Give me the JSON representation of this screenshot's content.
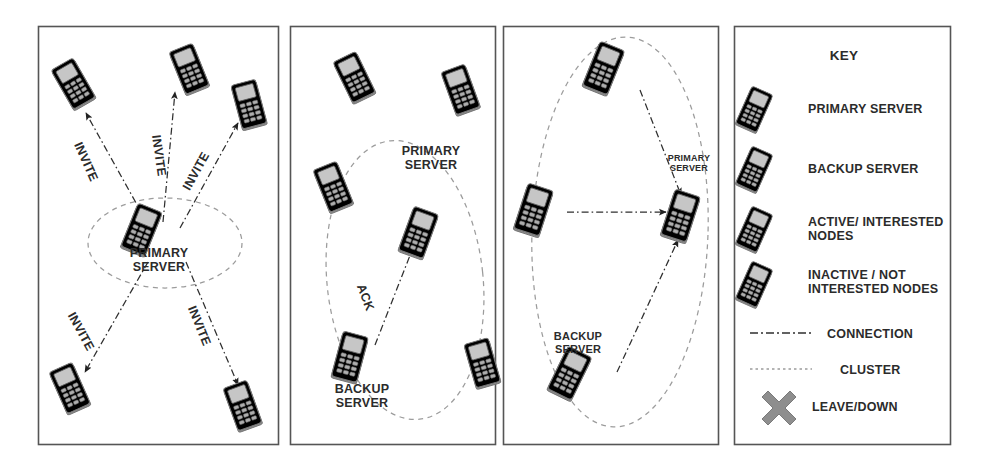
{
  "figure": {
    "background": "#ffffff",
    "frame_color": "#555555",
    "colors": {
      "primary_server": "#a8a8a8",
      "backup_server": "#8e8e8e",
      "active_node": "#6b6b6b",
      "inactive_node": "#ffffff",
      "inactive_outline": "#8a8a8a",
      "text": "#2b2b2b",
      "connection": "#3a3a3a",
      "cluster": "#9a9a9a",
      "leave_down": "#8e8e8e"
    }
  },
  "panels": [
    {
      "id": "panel-1",
      "name": "invite-phase",
      "cluster_label": "PRIMARY\nSERVER",
      "edge_labels": [
        "INVITE",
        "INVITE",
        "INVITE",
        "INVITE",
        "INVITE"
      ],
      "nodes": [
        {
          "role": "inactive",
          "name": "node-top-left"
        },
        {
          "role": "inactive",
          "name": "node-top-center"
        },
        {
          "role": "inactive",
          "name": "node-right"
        },
        {
          "role": "inactive",
          "name": "node-bottom-left"
        },
        {
          "role": "inactive",
          "name": "node-bottom-right"
        },
        {
          "role": "primary",
          "name": "primary-server"
        }
      ]
    },
    {
      "id": "panel-2",
      "name": "ack-phase",
      "cluster_label": "PRIMARY\nSERVER",
      "backup_label": "BACKUP\nSERVER",
      "edge_labels": [
        "ACK"
      ],
      "nodes": [
        {
          "role": "inactive",
          "name": "node-top-left"
        },
        {
          "role": "inactive",
          "name": "node-top-right"
        },
        {
          "role": "inactive",
          "name": "node-mid-left"
        },
        {
          "role": "inactive",
          "name": "node-bottom-right"
        },
        {
          "role": "primary",
          "name": "primary-server"
        },
        {
          "role": "backup",
          "name": "backup-server"
        }
      ]
    },
    {
      "id": "panel-3",
      "name": "cluster-formed",
      "primary_label": "PRIMARY\nSERVER",
      "backup_label": "BACKUP\nSERVER",
      "nodes": [
        {
          "role": "active",
          "name": "node-top"
        },
        {
          "role": "active",
          "name": "node-left"
        },
        {
          "role": "primary",
          "name": "primary-server"
        },
        {
          "role": "backup",
          "name": "backup-server"
        }
      ]
    }
  ],
  "key": {
    "title": "KEY",
    "items": [
      {
        "icon": "phone-primary-icon",
        "label": "PRIMARY SERVER"
      },
      {
        "icon": "phone-backup-icon",
        "label": "BACKUP SERVER"
      },
      {
        "icon": "phone-active-icon",
        "label": "ACTIVE/ INTERESTED\nNODES"
      },
      {
        "icon": "phone-inactive-icon",
        "label": "INACTIVE / NOT\nINTERESTED NODES"
      },
      {
        "icon": "dashdot-line-icon",
        "label": "CONNECTION"
      },
      {
        "icon": "dotted-ellipse-icon",
        "label": "CLUSTER"
      },
      {
        "icon": "cross-x-icon",
        "label": "LEAVE/DOWN"
      }
    ]
  }
}
